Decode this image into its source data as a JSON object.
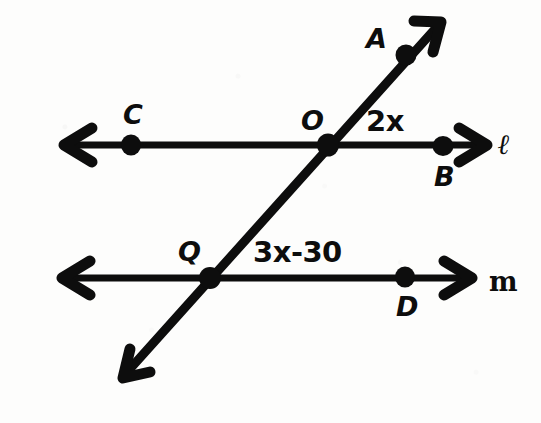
{
  "figure": {
    "kind": "geometry-diagram",
    "ink_color": "#0d0d0d",
    "paper_color": "#fdfdfc"
  },
  "lines": [
    {
      "id": "line-l",
      "name": "ℓ",
      "orientation": "horizontal",
      "y": 145,
      "x_start": 62,
      "x_end": 487,
      "arrow_start": true,
      "arrow_end": true,
      "label_x": 498,
      "label_y": 131
    },
    {
      "id": "line-m",
      "name": "m",
      "orientation": "horizontal",
      "y": 278,
      "x_start": 60,
      "x_end": 472,
      "arrow_start": true,
      "arrow_end": true,
      "label_x": 489,
      "label_y": 268
    },
    {
      "id": "transversal",
      "name": "",
      "orientation": "oblique",
      "x_start": 123,
      "y_start": 378,
      "x_end": 441,
      "y_end": 22,
      "arrow_start": true,
      "arrow_end": true
    }
  ],
  "points": [
    {
      "id": "point-c",
      "label": "C",
      "cx": 131,
      "cy": 145,
      "label_x": 123,
      "label_y": 101
    },
    {
      "id": "point-o",
      "label": "O",
      "cx": 328,
      "cy": 145,
      "label_x": 301,
      "label_y": 107
    },
    {
      "id": "point-b",
      "label": "B",
      "cx": 443,
      "cy": 146,
      "label_x": 434,
      "label_y": 163
    },
    {
      "id": "point-a",
      "label": "A",
      "cx": 406,
      "cy": 55,
      "label_x": 366,
      "label_y": 25
    },
    {
      "id": "point-q",
      "label": "Q",
      "cx": 210,
      "cy": 278,
      "label_x": 178,
      "label_y": 238
    },
    {
      "id": "point-d",
      "label": "D",
      "cx": 405,
      "cy": 277,
      "label_x": 396,
      "label_y": 293
    }
  ],
  "angle_labels": [
    {
      "id": "angle-aob",
      "text": "2x",
      "x": 366,
      "y": 107,
      "at_vertex": "O",
      "note": "angle between ray OA and ray OB on line ℓ"
    },
    {
      "id": "angle-oqd",
      "text": "3x-30",
      "x": 253,
      "y": 238,
      "at_vertex": "Q",
      "note": "angle between ray QO and ray QD on line m"
    }
  ]
}
